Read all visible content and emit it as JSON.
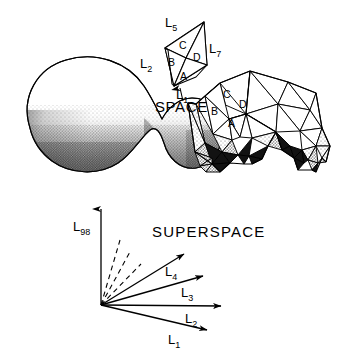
{
  "figure": {
    "title_space": "SPACE",
    "title_superspace": "SUPERSPACE",
    "smooth_blob": {
      "name": "smooth-arch-surface",
      "description": "stippled kidney-shaped arch silhouette"
    },
    "small_polygon": {
      "faces": [
        {
          "id": "A",
          "label": "A"
        },
        {
          "id": "B",
          "label": "B"
        },
        {
          "id": "C",
          "label": "C"
        },
        {
          "id": "D",
          "label": "D"
        }
      ],
      "edge_labels": [
        {
          "id": "L5",
          "base": "L",
          "sub": "5"
        },
        {
          "id": "L7",
          "base": "L",
          "sub": "7"
        },
        {
          "id": "L2",
          "base": "L",
          "sub": "2"
        },
        {
          "id": "L1",
          "base": "L",
          "sub": "1"
        }
      ]
    },
    "mesh": {
      "name": "triangulated-arch-mesh",
      "faces": [
        {
          "id": "A",
          "label": "A"
        },
        {
          "id": "B",
          "label": "B"
        },
        {
          "id": "C",
          "label": "C"
        },
        {
          "id": "D",
          "label": "D"
        }
      ]
    },
    "superspace": {
      "axis_label": {
        "base": "L",
        "sub": "98"
      },
      "vectors": [
        {
          "base": "L",
          "sub": "4"
        },
        {
          "base": "L",
          "sub": "3"
        },
        {
          "base": "L",
          "sub": "2"
        },
        {
          "base": "L",
          "sub": "1"
        }
      ],
      "dashed_ray_count": 3
    },
    "colors": {
      "ink": "#000000",
      "paper": "#ffffff",
      "stipple_light": "#b8b8b8",
      "stipple_mid": "#808080",
      "shade_dark": "#1a1a1a"
    }
  }
}
